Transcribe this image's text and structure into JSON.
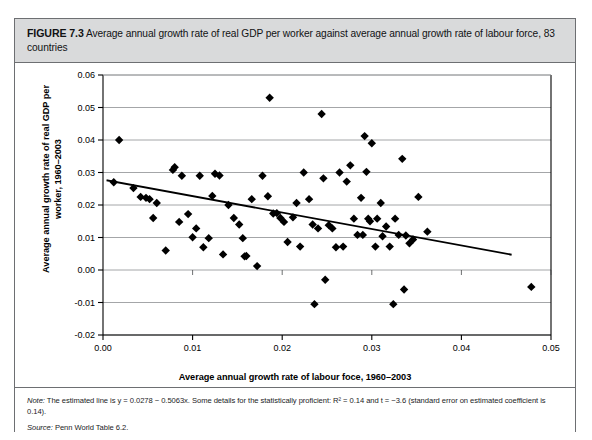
{
  "figure": {
    "label": "FIGURE 7.3",
    "caption": "Average annual growth rate of real GDP per worker against average annual growth rate of labour force, 83 countries",
    "note_label": "Note:",
    "note_text": " The estimated line is y = 0.0278 − 0.5063x. Some details for the statistically proficient: R² = 0.14 and t = −3.6 (standard error on estimated coefficient is 0.14).",
    "source_label": "Source:",
    "source_text": " Penn World Table 6.2."
  },
  "colors": {
    "caption_background": "#d9dadb",
    "border": "#6d6f72",
    "gridline": "#9a9c9e",
    "axis": "#000000",
    "marker": "#000000",
    "trendline": "#000000",
    "plot_background": "#ffffff"
  },
  "chart_data": {
    "type": "scatter",
    "title": "Average annual growth rate of real GDP per worker against average annual growth rate of labour force, 83 countries",
    "xlabel": "Average annual growth rate of labour foce, 1960–2003",
    "ylabel": "Average annual growth rate of real GDP per worker, 1960–2003",
    "xlim": [
      0.0,
      0.05
    ],
    "ylim": [
      -0.02,
      0.06
    ],
    "xticks": [
      0.0,
      0.01,
      0.02,
      0.03,
      0.04,
      0.05
    ],
    "xtick_labels": [
      "0.00",
      "0.01",
      "0.02",
      "0.03",
      "0.04",
      "0.05"
    ],
    "yticks": [
      -0.02,
      -0.01,
      0.0,
      0.01,
      0.02,
      0.03,
      0.04,
      0.05,
      0.06
    ],
    "ytick_labels": [
      "-0.02",
      "-0.01",
      "0.00",
      "0.01",
      "0.02",
      "0.03",
      "0.04",
      "0.05",
      "0.06"
    ],
    "grid": "horizontal",
    "legend": null,
    "marker": "diamond",
    "marker_size": 4.2,
    "n_points": 83,
    "trendline": {
      "equation": "y = 0.0278 - 0.5063x",
      "intercept": 0.0278,
      "slope": -0.5063,
      "r_squared": 0.14,
      "t_stat": -3.6,
      "standard_error": 0.14,
      "x_start": 0.0005,
      "x_end": 0.0455
    },
    "points": [
      [
        0.0012,
        0.027
      ],
      [
        0.0018,
        0.04
      ],
      [
        0.0034,
        0.0252
      ],
      [
        0.0042,
        0.0225
      ],
      [
        0.0048,
        0.0222
      ],
      [
        0.0052,
        0.0218
      ],
      [
        0.0056,
        0.016
      ],
      [
        0.006,
        0.0206
      ],
      [
        0.007,
        0.006
      ],
      [
        0.0078,
        0.0308
      ],
      [
        0.008,
        0.0316
      ],
      [
        0.0085,
        0.0148
      ],
      [
        0.0088,
        0.029
      ],
      [
        0.0095,
        0.0172
      ],
      [
        0.01,
        0.0101
      ],
      [
        0.0104,
        0.0128
      ],
      [
        0.0108,
        0.029
      ],
      [
        0.0112,
        0.007
      ],
      [
        0.0118,
        0.0098
      ],
      [
        0.0122,
        0.0228
      ],
      [
        0.0125,
        0.0296
      ],
      [
        0.013,
        0.0291
      ],
      [
        0.0134,
        0.0048
      ],
      [
        0.014,
        0.02
      ],
      [
        0.0146,
        0.016
      ],
      [
        0.0152,
        0.014
      ],
      [
        0.0156,
        0.0098
      ],
      [
        0.0158,
        0.0042
      ],
      [
        0.016,
        0.0043
      ],
      [
        0.0166,
        0.0218
      ],
      [
        0.0172,
        0.0012
      ],
      [
        0.0178,
        0.029
      ],
      [
        0.0184,
        0.0227
      ],
      [
        0.0186,
        0.053
      ],
      [
        0.019,
        0.0174
      ],
      [
        0.0194,
        0.0175
      ],
      [
        0.0198,
        0.016
      ],
      [
        0.0202,
        0.0148
      ],
      [
        0.0206,
        0.0086
      ],
      [
        0.0212,
        0.0162
      ],
      [
        0.0216,
        0.0206
      ],
      [
        0.022,
        0.0072
      ],
      [
        0.0224,
        0.03
      ],
      [
        0.023,
        0.0218
      ],
      [
        0.0234,
        0.014
      ],
      [
        0.0236,
        -0.0105
      ],
      [
        0.024,
        0.0128
      ],
      [
        0.0244,
        0.048
      ],
      [
        0.0246,
        0.0282
      ],
      [
        0.0248,
        -0.003
      ],
      [
        0.0252,
        0.0138
      ],
      [
        0.0256,
        0.0128
      ],
      [
        0.026,
        0.007
      ],
      [
        0.0264,
        0.03
      ],
      [
        0.0268,
        0.0072
      ],
      [
        0.0272,
        0.0272
      ],
      [
        0.0276,
        0.0322
      ],
      [
        0.028,
        0.0158
      ],
      [
        0.0284,
        0.0108
      ],
      [
        0.0288,
        0.0222
      ],
      [
        0.029,
        0.0108
      ],
      [
        0.0292,
        0.0412
      ],
      [
        0.0294,
        0.0302
      ],
      [
        0.0296,
        0.0158
      ],
      [
        0.0298,
        0.015
      ],
      [
        0.03,
        0.039
      ],
      [
        0.0304,
        0.0072
      ],
      [
        0.0306,
        0.0158
      ],
      [
        0.031,
        0.0206
      ],
      [
        0.0312,
        0.0104
      ],
      [
        0.0316,
        0.0134
      ],
      [
        0.032,
        0.0072
      ],
      [
        0.0324,
        -0.0105
      ],
      [
        0.0326,
        0.0158
      ],
      [
        0.033,
        0.0108
      ],
      [
        0.0334,
        0.0342
      ],
      [
        0.0336,
        -0.006
      ],
      [
        0.0338,
        0.0106
      ],
      [
        0.0342,
        0.0082
      ],
      [
        0.0346,
        0.0094
      ],
      [
        0.0352,
        0.0225
      ],
      [
        0.0362,
        0.0118
      ],
      [
        0.0478,
        -0.0052
      ]
    ]
  }
}
